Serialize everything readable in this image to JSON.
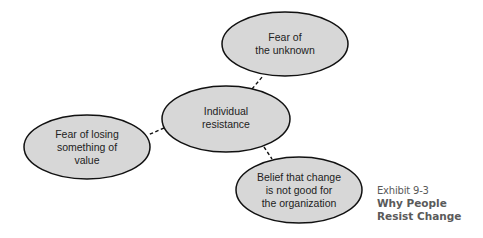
{
  "diagram": {
    "fill_color": "#d7d7d7",
    "stroke_color": "#111111",
    "connector_style": "dashed",
    "nodes": [
      {
        "id": "center",
        "lines": [
          "Individual",
          "resistance"
        ],
        "cx": 226,
        "cy": 119,
        "rx": 64,
        "ry": 33
      },
      {
        "id": "top",
        "lines": [
          "Fear of",
          "the unknown"
        ],
        "cx": 285,
        "cy": 44,
        "rx": 63,
        "ry": 32
      },
      {
        "id": "left",
        "lines": [
          "Fear of losing",
          "something of",
          "value"
        ],
        "cx": 87,
        "cy": 147,
        "rx": 63,
        "ry": 32
      },
      {
        "id": "bottom-right",
        "lines": [
          "Belief that change",
          "is not good for",
          "the organization"
        ],
        "cx": 299,
        "cy": 190,
        "rx": 63,
        "ry": 33
      }
    ],
    "edges": [
      {
        "from": "center",
        "to": "top",
        "x1": 252,
        "y1": 89,
        "x2": 263,
        "y2": 76
      },
      {
        "from": "center",
        "to": "left",
        "x1": 164,
        "y1": 128,
        "x2": 148,
        "y2": 135
      },
      {
        "from": "center",
        "to": "bottom-right",
        "x1": 264,
        "y1": 147,
        "x2": 272,
        "y2": 159
      }
    ]
  },
  "caption": {
    "exhibit": "Exhibit 9-3",
    "title_lines": [
      "Why People",
      "Resist Change"
    ],
    "color": "#5a5a5a"
  }
}
